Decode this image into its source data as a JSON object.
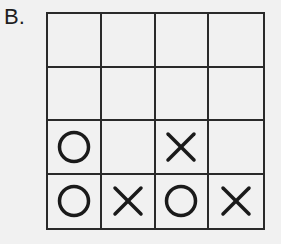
{
  "label": "B.",
  "board": {
    "rows": 4,
    "cols": 4,
    "cells": [
      [
        "",
        "",
        "",
        ""
      ],
      [
        "",
        "",
        "",
        ""
      ],
      [
        "O",
        "",
        "X",
        ""
      ],
      [
        "O",
        "X",
        "O",
        "X"
      ]
    ]
  },
  "colors": {
    "line": "#2a2a2a",
    "mark": "#1a1a1a",
    "background": "#f1f1f1"
  }
}
